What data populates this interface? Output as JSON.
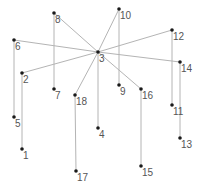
{
  "diagram": {
    "type": "tree-graph",
    "colors": {
      "edge": "#b4b4b4",
      "node": "#1a1a1a",
      "label": "#555555",
      "background": "#ffffff"
    },
    "nodes": [
      {
        "id": "1",
        "label": "1",
        "x": 22,
        "y": 149
      },
      {
        "id": "2",
        "label": "2",
        "x": 22,
        "y": 73
      },
      {
        "id": "3",
        "label": "3",
        "x": 98,
        "y": 52
      },
      {
        "id": "4",
        "label": "4",
        "x": 98,
        "y": 128
      },
      {
        "id": "5",
        "label": "5",
        "x": 14,
        "y": 117
      },
      {
        "id": "6",
        "label": "6",
        "x": 14,
        "y": 40
      },
      {
        "id": "7",
        "label": "7",
        "x": 54,
        "y": 89
      },
      {
        "id": "8",
        "label": "8",
        "x": 54,
        "y": 13
      },
      {
        "id": "9",
        "label": "9",
        "x": 119,
        "y": 85
      },
      {
        "id": "10",
        "label": "10",
        "x": 119,
        "y": 9
      },
      {
        "id": "11",
        "label": "11",
        "x": 172,
        "y": 105
      },
      {
        "id": "12",
        "label": "12",
        "x": 172,
        "y": 30
      },
      {
        "id": "13",
        "label": "13",
        "x": 180,
        "y": 138
      },
      {
        "id": "14",
        "label": "14",
        "x": 180,
        "y": 62
      },
      {
        "id": "15",
        "label": "15",
        "x": 141,
        "y": 166
      },
      {
        "id": "16",
        "label": "16",
        "x": 141,
        "y": 89
      },
      {
        "id": "17",
        "label": "17",
        "x": 76,
        "y": 171
      },
      {
        "id": "18",
        "label": "18",
        "x": 75,
        "y": 95
      }
    ],
    "edges": [
      [
        "3",
        "8"
      ],
      [
        "3",
        "6"
      ],
      [
        "3",
        "2"
      ],
      [
        "3",
        "10"
      ],
      [
        "3",
        "12"
      ],
      [
        "3",
        "14"
      ],
      [
        "3",
        "16"
      ],
      [
        "3",
        "18"
      ],
      [
        "3",
        "4"
      ],
      [
        "8",
        "7"
      ],
      [
        "10",
        "9"
      ],
      [
        "6",
        "5"
      ],
      [
        "2",
        "1"
      ],
      [
        "12",
        "11"
      ],
      [
        "14",
        "13"
      ],
      [
        "16",
        "15"
      ],
      [
        "18",
        "17"
      ]
    ]
  }
}
